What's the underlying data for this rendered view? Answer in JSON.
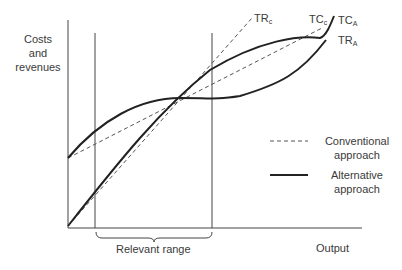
{
  "diagram": {
    "y_axis_label": "Costs and revenues",
    "y_axis_label_lines": [
      "Costs",
      "and",
      "revenues"
    ],
    "x_axis_label": "Output",
    "range_label": "Relevant range",
    "curves": [
      {
        "id": "TR_C",
        "base": "TR",
        "sub": "c",
        "style": "dashed",
        "approach": "Conventional"
      },
      {
        "id": "TC_C",
        "base": "TC",
        "sub": "c",
        "style": "dashed",
        "approach": "Conventional"
      },
      {
        "id": "TC_A",
        "base": "TC",
        "sub": "A",
        "style": "solid",
        "approach": "Alternative"
      },
      {
        "id": "TR_A",
        "base": "TR",
        "sub": "A",
        "style": "solid",
        "approach": "Alternative"
      }
    ],
    "labels": {
      "trc": {
        "base": "TR",
        "sub": "c"
      },
      "tcc": {
        "base": "TC",
        "sub": "c"
      },
      "tca": {
        "base": "TC",
        "sub": "A"
      },
      "tra": {
        "base": "TR",
        "sub": "A"
      }
    },
    "legend": [
      {
        "style": "dashed",
        "line1": "Conventional",
        "line2": "approach"
      },
      {
        "style": "solid",
        "line1": "Alternative",
        "line2": "approach"
      }
    ],
    "colors": {
      "line": "#222222",
      "dashed": "#555555",
      "text": "#3a3a3a"
    }
  }
}
